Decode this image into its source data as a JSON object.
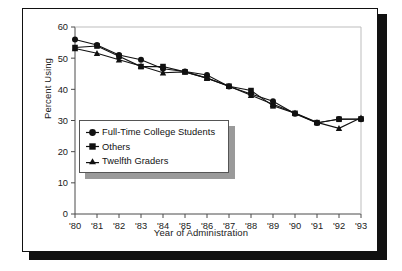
{
  "figure": {
    "frame_color": "#111111",
    "shadow_color": "#111111",
    "background": "#ffffff"
  },
  "axis": {
    "y_title": "Percent Using",
    "x_title": "Year of Administration",
    "y_ticks": [
      "0",
      "10",
      "20",
      "30",
      "40",
      "50",
      "60"
    ],
    "x_ticks": [
      "'80",
      "'81",
      "'82",
      "'83",
      "'84",
      "'85",
      "'86",
      "'87",
      "'88",
      "'89",
      "'90",
      "'91",
      "'92",
      "'93"
    ]
  },
  "legend": {
    "items": [
      {
        "label": "Full-Time College Students",
        "marker": "circle-marker-icon"
      },
      {
        "label": "Others",
        "marker": "square-marker-icon"
      },
      {
        "label": "Twelfth Graders",
        "marker": "triangle-marker-icon"
      }
    ]
  },
  "chart_data": {
    "type": "line",
    "title": "",
    "subtitle": "",
    "xlabel": "Year of Administration",
    "ylabel": "Percent Using",
    "x": [
      "'80",
      "'81",
      "'82",
      "'83",
      "'84",
      "'85",
      "'86",
      "'87",
      "'88",
      "'89",
      "'90",
      "'91",
      "'92",
      "'93"
    ],
    "xlim": [
      0,
      13
    ],
    "ylim": [
      0,
      60
    ],
    "ytick_step": 10,
    "grid": false,
    "legend_position": "inside-lower-left",
    "series": [
      {
        "name": "Full-Time College Students",
        "marker": "circle",
        "color": "#111111",
        "values": [
          56.0,
          54.2,
          51.0,
          49.5,
          46.6,
          45.7,
          44.6,
          40.9,
          38.5,
          36.2,
          32.2,
          29.2,
          30.5,
          30.4
        ]
      },
      {
        "name": "Others",
        "marker": "square",
        "color": "#111111",
        "values": [
          53.4,
          53.9,
          50.6,
          47.3,
          47.3,
          45.6,
          43.6,
          41.0,
          39.6,
          34.7,
          32.3,
          29.3,
          30.4,
          30.5
        ]
      },
      {
        "name": "Twelfth Graders",
        "marker": "triangle",
        "color": "#111111",
        "values": [
          53.1,
          51.6,
          49.5,
          47.5,
          45.3,
          45.6,
          43.6,
          41.0,
          38.1,
          35.2,
          32.4,
          29.4,
          27.5,
          30.9
        ]
      }
    ]
  }
}
